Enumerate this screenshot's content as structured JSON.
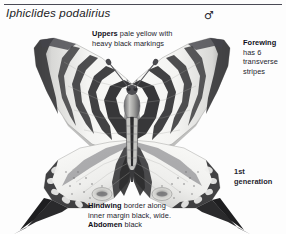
{
  "page": {
    "title": "Iphiclides podalirius",
    "sex_symbol": "♂",
    "sex_symbol_name": "male-symbol"
  },
  "annotations": {
    "uppers": {
      "lead": "Uppers",
      "line1_rest": " pale yellow with",
      "line2": "heavy black markings"
    },
    "forewing": {
      "lead": "Forewing",
      "line2": "has 6",
      "line3": "transverse",
      "line4": "stripes"
    },
    "generation": {
      "line1": "1st",
      "line2": "generation"
    },
    "hindwing": {
      "lead": "Hindwing",
      "line1_rest": " border along",
      "line2": "inner margin black, wide.",
      "lead2": "Abdomen",
      "line3_rest": " black"
    }
  },
  "specimen": {
    "name": "scarce-swallowtail-specimen",
    "description": "grayscale pinned butterfly specimen, wings spread",
    "colors": {
      "wing_pale": "#f2f2f0",
      "wing_mid": "#bdbdbc",
      "wing_stripe": "#2e2e30",
      "body_dark": "#3a3a3c",
      "background": "#fdfdfd",
      "rule": "#4a4a55",
      "text": "#25252e"
    }
  }
}
